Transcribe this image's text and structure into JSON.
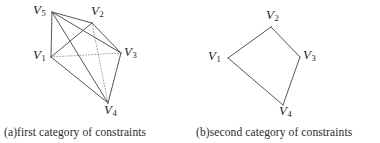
{
  "figure": {
    "background_color": "#ffffff",
    "line_color": "#555555",
    "dotted_line_color": "#8d8d8d",
    "text_color": "#1b1b1b"
  },
  "panels": [
    {
      "id": "a",
      "caption": "(a)first category of constraints",
      "vertices": [
        {
          "name": "V1",
          "letter": "V",
          "sub": "1",
          "x": 51,
          "y": 57,
          "label_x": 33,
          "label_y": 48
        },
        {
          "name": "V2",
          "letter": "V",
          "sub": "2",
          "x": 92,
          "y": 23,
          "label_x": 91,
          "label_y": 4
        },
        {
          "name": "V3",
          "letter": "V",
          "sub": "3",
          "x": 121,
          "y": 53,
          "label_x": 124,
          "label_y": 45
        },
        {
          "name": "V4",
          "letter": "V",
          "sub": "4",
          "x": 108,
          "y": 103,
          "label_x": 104,
          "label_y": 103
        },
        {
          "name": "V5",
          "letter": "V",
          "sub": "5",
          "x": 52,
          "y": 12,
          "label_x": 33,
          "label_y": 3
        }
      ],
      "edges": [
        {
          "from": "V5",
          "to": "V1",
          "style": "solid"
        },
        {
          "from": "V5",
          "to": "V2",
          "style": "solid"
        },
        {
          "from": "V5",
          "to": "V3",
          "style": "solid"
        },
        {
          "from": "V5",
          "to": "V4",
          "style": "solid"
        },
        {
          "from": "V1",
          "to": "V2",
          "style": "solid"
        },
        {
          "from": "V1",
          "to": "V4",
          "style": "solid"
        },
        {
          "from": "V2",
          "to": "V3",
          "style": "solid"
        },
        {
          "from": "V3",
          "to": "V4",
          "style": "solid"
        },
        {
          "from": "V1",
          "to": "V3",
          "style": "dotted"
        },
        {
          "from": "V2",
          "to": "V4",
          "style": "dotted"
        }
      ]
    },
    {
      "id": "b",
      "caption": "(b)second category of constraints",
      "vertices": [
        {
          "name": "V1",
          "letter": "V",
          "sub": "1",
          "x": 38,
          "y": 58,
          "label_x": 18,
          "label_y": 49
        },
        {
          "name": "V2",
          "letter": "V",
          "sub": "2",
          "x": 81,
          "y": 27,
          "label_x": 76,
          "label_y": 8
        },
        {
          "name": "V3",
          "letter": "V",
          "sub": "3",
          "x": 110,
          "y": 57,
          "label_x": 113,
          "label_y": 48
        },
        {
          "name": "V4",
          "letter": "V",
          "sub": "4",
          "x": 93,
          "y": 105,
          "label_x": 89,
          "label_y": 104
        }
      ],
      "edges": [
        {
          "from": "V1",
          "to": "V2",
          "style": "solid"
        },
        {
          "from": "V2",
          "to": "V3",
          "style": "solid"
        },
        {
          "from": "V3",
          "to": "V4",
          "style": "solid"
        },
        {
          "from": "V4",
          "to": "V1",
          "style": "solid"
        }
      ]
    }
  ]
}
